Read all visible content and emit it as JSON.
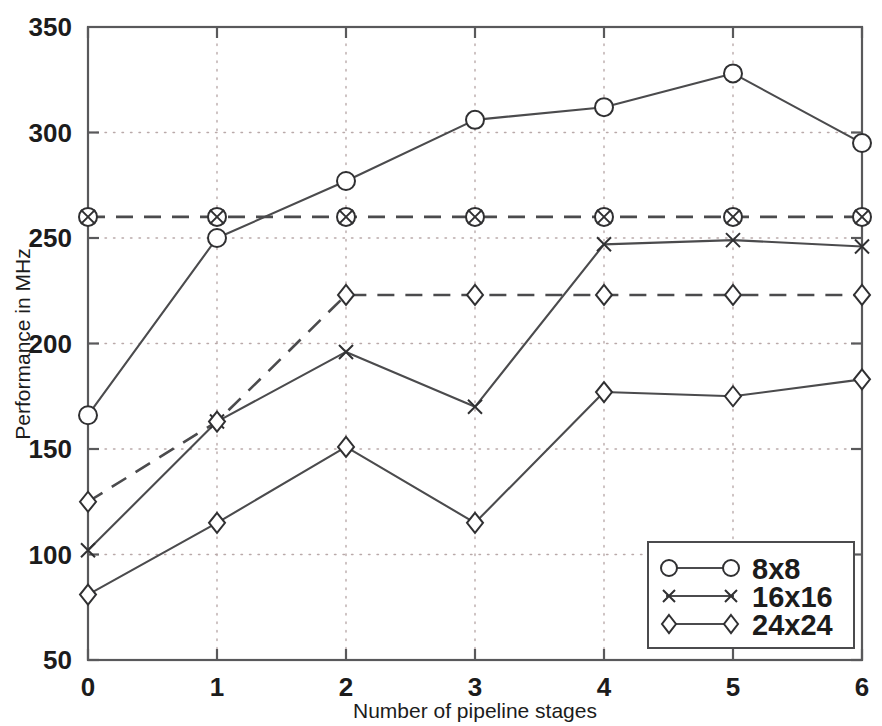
{
  "chart_data": {
    "type": "line",
    "title": "",
    "xlabel": "Number of pipeline stages",
    "ylabel": "Performance in MHz",
    "x": [
      0,
      1,
      2,
      3,
      4,
      5,
      6
    ],
    "xlim": [
      0,
      6
    ],
    "ylim": [
      50,
      350
    ],
    "xticks": [
      "0",
      "1",
      "2",
      "3",
      "4",
      "5",
      "6"
    ],
    "yticks": [
      "50",
      "100",
      "150",
      "200",
      "250",
      "300",
      "350"
    ],
    "grid": true,
    "legend_position": "lower right",
    "series": [
      {
        "name": "8x8",
        "marker": "circle",
        "linestyle": "solid",
        "values": [
          166,
          250,
          277,
          306,
          312,
          328,
          295
        ]
      },
      {
        "name": "16x16",
        "marker": "x",
        "linestyle": "solid",
        "values": [
          102,
          163,
          196,
          170,
          247,
          249,
          246
        ]
      },
      {
        "name": "24x24",
        "marker": "diamond",
        "linestyle": "solid",
        "values": [
          81,
          115,
          151,
          115,
          177,
          175,
          183
        ]
      },
      {
        "name": "8x8-reference",
        "marker": "circle-x",
        "linestyle": "dashed",
        "values": [
          260,
          260,
          260,
          260,
          260,
          260,
          260
        ]
      },
      {
        "name": "24x24-reference",
        "marker": "diamond",
        "linestyle": "dashed",
        "values": [
          125,
          163,
          223,
          223,
          223,
          223,
          223
        ]
      }
    ],
    "legend": [
      {
        "label": "8x8",
        "marker": "circle"
      },
      {
        "label": "16x16",
        "marker": "x"
      },
      {
        "label": "24x24",
        "marker": "diamond"
      }
    ],
    "colors": {
      "line": "#4b4b4d",
      "axis": "#59595b",
      "grid": "#b9a9a9",
      "marker_fill": "#ffffff",
      "text": "#1c1c1c"
    }
  }
}
